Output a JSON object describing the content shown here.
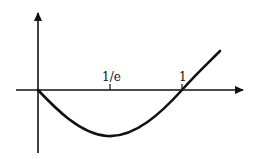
{
  "diagram": {
    "function": "x ln x",
    "x_axis": {
      "arrow": true
    },
    "y_axis": {
      "arrow": true
    },
    "tick_labels": [
      {
        "id": "one-over-e",
        "label": "1/e",
        "x_value": 0.3679
      },
      {
        "id": "one",
        "label": "1",
        "x_value": 1
      }
    ],
    "features": {
      "origin_value": 0,
      "minimum_at": "1/e",
      "root_at": "1"
    },
    "colors": {
      "stroke": "#111111",
      "background": "#ffffff"
    }
  }
}
